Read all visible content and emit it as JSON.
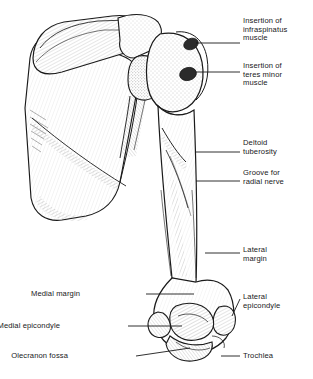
{
  "figure": {
    "background_color": "#ffffff",
    "ink_color": "#1a1a1a",
    "width": 313,
    "height": 379
  },
  "labels": [
    {
      "id": "insertion-infraspinatus",
      "text": "Insertion of\ninfraspinatus\nmuscle",
      "side": "right",
      "x": 243,
      "y": 17,
      "leader": {
        "x1": 196,
        "y1": 43,
        "x2": 240,
        "y2": 43
      },
      "target_structure": "infraspinatus insertion facet on greater tubercle"
    },
    {
      "id": "insertion-teres-minor",
      "text": "Insertion of\nteres minor\nmuscle",
      "side": "right",
      "x": 243,
      "y": 62,
      "leader": {
        "x1": 196,
        "y1": 72,
        "x2": 240,
        "y2": 72
      },
      "target_structure": "teres minor insertion facet on greater tubercle"
    },
    {
      "id": "deltoid-tuberosity",
      "text": "Deltoid\ntuberosity",
      "side": "right",
      "x": 243,
      "y": 139,
      "leader": {
        "x1": 196,
        "y1": 152,
        "x2": 240,
        "y2": 152
      },
      "target_structure": "deltoid tuberosity on lateral shaft"
    },
    {
      "id": "groove-radial-nerve",
      "text": "Groove for\nradial nerve",
      "side": "right",
      "x": 243,
      "y": 169,
      "leader": {
        "x1": 196,
        "y1": 181,
        "x2": 240,
        "y2": 181
      },
      "target_structure": "spiral (radial) groove"
    },
    {
      "id": "lateral-margin",
      "text": "Lateral\nmargin",
      "side": "right",
      "x": 243,
      "y": 246,
      "leader": {
        "x1": 205,
        "y1": 253,
        "x2": 240,
        "y2": 253
      },
      "target_structure": "lateral border of humeral shaft"
    },
    {
      "id": "lateral-epicondyle",
      "text": "Lateral\nepicondyle",
      "side": "right",
      "x": 243,
      "y": 293,
      "leader": {
        "x1": 232,
        "y1": 316,
        "x2": 240,
        "y2": 299
      },
      "target_structure": "lateral epicondyle"
    },
    {
      "id": "trochlea",
      "text": "Trochlea",
      "side": "right",
      "x": 243,
      "y": 352,
      "leader": {
        "x1": 221,
        "y1": 356,
        "x2": 240,
        "y2": 356
      },
      "target_structure": "trochlea"
    },
    {
      "id": "medial-margin",
      "text": "Medial margin",
      "side": "left",
      "x": 80,
      "y": 290,
      "leader": {
        "x1": 146,
        "y1": 294,
        "x2": 194,
        "y2": 294
      },
      "target_structure": "medial border of humeral shaft"
    },
    {
      "id": "medial-epicondyle",
      "text": "Medial epicondyle",
      "side": "left",
      "x": 60,
      "y": 322,
      "leader": {
        "x1": 128,
        "y1": 326,
        "x2": 182,
        "y2": 326
      },
      "target_structure": "medial epicondyle"
    },
    {
      "id": "olecranon-fossa",
      "text": "Olecranon fossa",
      "side": "left",
      "x": 68,
      "y": 352,
      "leader": {
        "x1": 136,
        "y1": 356,
        "x2": 190,
        "y2": 348
      },
      "target_structure": "olecranon fossa"
    }
  ]
}
